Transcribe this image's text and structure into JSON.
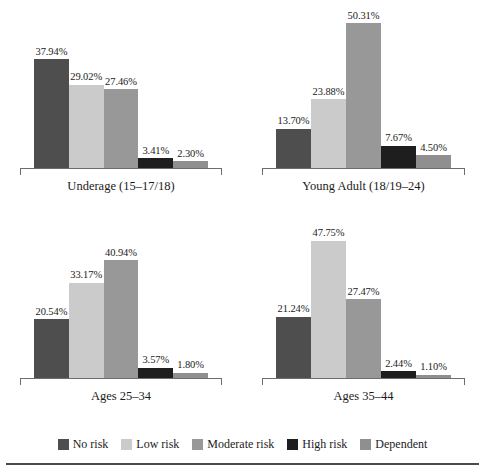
{
  "chart_data": {
    "type": "bar",
    "title": "",
    "xlabel": "",
    "ylabel": "",
    "grid": false,
    "ylim": [
      0,
      55
    ],
    "legend_position": "bottom",
    "value_suffix": "%",
    "categories": [
      "No risk",
      "Low risk",
      "Moderate risk",
      "High risk",
      "Dependent"
    ],
    "series": [
      {
        "name": "Underage (15–17/18)",
        "values": [
          37.94,
          29.02,
          27.46,
          3.41,
          2.3
        ],
        "labels": [
          "37.94%",
          "29.02%",
          "27.46%",
          "3.41%",
          "2.30%"
        ]
      },
      {
        "name": "Young Adult (18/19–24)",
        "values": [
          13.7,
          23.88,
          50.31,
          7.67,
          4.5
        ],
        "labels": [
          "13.70%",
          "23.88%",
          "50.31%",
          "7.67%",
          "4.50%"
        ]
      },
      {
        "name": "Ages 25–34",
        "values": [
          20.54,
          33.17,
          40.94,
          3.57,
          1.8
        ],
        "labels": [
          "20.54%",
          "33.17%",
          "40.94%",
          "3.57%",
          "1.80%"
        ]
      },
      {
        "name": "Ages 35–44",
        "values": [
          21.24,
          47.75,
          27.47,
          2.44,
          1.1
        ],
        "labels": [
          "21.24%",
          "47.75%",
          "27.47%",
          "2.44%",
          "1.10%"
        ]
      }
    ],
    "colors": [
      "#4e4e4e",
      "#cbcbcb",
      "#989898",
      "#1e1e1e",
      "#8f8f8f"
    ]
  },
  "panels": [
    {
      "caption": "Underage (15–17/18)",
      "bars": [
        {
          "label": "37.94%",
          "value": 37.94,
          "color": "#4e4e4e",
          "series": "No risk"
        },
        {
          "label": "29.02%",
          "value": 29.02,
          "color": "#cbcbcb",
          "series": "Low risk"
        },
        {
          "label": "27.46%",
          "value": 27.46,
          "color": "#989898",
          "series": "Moderate risk"
        },
        {
          "label": "3.41%",
          "value": 3.41,
          "color": "#1e1e1e",
          "series": "High risk"
        },
        {
          "label": "2.30%",
          "value": 2.3,
          "color": "#8f8f8f",
          "series": "Dependent"
        }
      ]
    },
    {
      "caption": "Young Adult (18/19–24)",
      "bars": [
        {
          "label": "13.70%",
          "value": 13.7,
          "color": "#4e4e4e",
          "series": "No risk"
        },
        {
          "label": "23.88%",
          "value": 23.88,
          "color": "#cbcbcb",
          "series": "Low risk"
        },
        {
          "label": "50.31%",
          "value": 50.31,
          "color": "#989898",
          "series": "Moderate risk"
        },
        {
          "label": "7.67%",
          "value": 7.67,
          "color": "#1e1e1e",
          "series": "High risk"
        },
        {
          "label": "4.50%",
          "value": 4.5,
          "color": "#8f8f8f",
          "series": "Dependent"
        }
      ]
    },
    {
      "caption": "Ages 25–34",
      "bars": [
        {
          "label": "20.54%",
          "value": 20.54,
          "color": "#4e4e4e",
          "series": "No risk"
        },
        {
          "label": "33.17%",
          "value": 33.17,
          "color": "#cbcbcb",
          "series": "Low risk"
        },
        {
          "label": "40.94%",
          "value": 40.94,
          "color": "#989898",
          "series": "Moderate risk"
        },
        {
          "label": "3.57%",
          "value": 3.57,
          "color": "#1e1e1e",
          "series": "High risk"
        },
        {
          "label": "1.80%",
          "value": 1.8,
          "color": "#8f8f8f",
          "series": "Dependent"
        }
      ]
    },
    {
      "caption": "Ages 35–44",
      "bars": [
        {
          "label": "21.24%",
          "value": 21.24,
          "color": "#4e4e4e",
          "series": "No risk"
        },
        {
          "label": "47.75%",
          "value": 47.75,
          "color": "#cbcbcb",
          "series": "Low risk"
        },
        {
          "label": "27.47%",
          "value": 27.47,
          "color": "#989898",
          "series": "Moderate risk"
        },
        {
          "label": "2.44%",
          "value": 2.44,
          "color": "#1e1e1e",
          "series": "High risk"
        },
        {
          "label": "1.10%",
          "value": 1.1,
          "color": "#8f8f8f",
          "series": "Dependent"
        }
      ]
    }
  ],
  "legend": {
    "items": [
      {
        "label": "No risk",
        "color": "#4e4e4e"
      },
      {
        "label": "Low risk",
        "color": "#cbcbcb"
      },
      {
        "label": "Moderate risk",
        "color": "#989898"
      },
      {
        "label": "High risk",
        "color": "#1e1e1e"
      },
      {
        "label": "Dependent",
        "color": "#8f8f8f"
      }
    ]
  },
  "scale": {
    "max_value": 55
  }
}
